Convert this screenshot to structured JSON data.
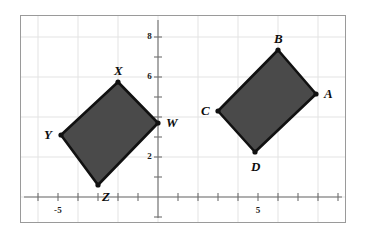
{
  "figure": {
    "background_color": "#ffffff",
    "frame_color": "#9a9a9a",
    "grid_color": "#e3e3e3",
    "axis_color": "#6f6f6f",
    "shape_fill_color": "#4a4a4a",
    "shape_stroke_color": "#111111",
    "vertex_dot_color": "#111111"
  },
  "axes": {
    "x_tick_labels": [
      {
        "text": "-5",
        "value": -5
      },
      {
        "text": "5",
        "value": 5
      }
    ],
    "y_tick_labels": [
      {
        "text": "8",
        "value": 8
      },
      {
        "text": "6",
        "value": 6
      },
      {
        "text": "2",
        "value": 2
      }
    ],
    "x_range": [
      -7,
      10.4
    ],
    "y_range": [
      -1.2,
      10.4
    ],
    "tick_interval": 1,
    "grid_interval": 2
  },
  "chart_data": {
    "type": "scatter",
    "xlabel": "",
    "ylabel": "",
    "xlim": [
      -7,
      10.4
    ],
    "ylim": [
      -1.2,
      10.4
    ],
    "grid": true,
    "legend": "none",
    "series": [
      {
        "name": "Quadrilateral WXYZ",
        "closed": true,
        "points": [
          {
            "label": "W",
            "x": 0.0,
            "y": 3.7,
            "label_position": "right"
          },
          {
            "label": "X",
            "x": -2.0,
            "y": 5.75,
            "label_position": "above"
          },
          {
            "label": "Y",
            "x": -4.85,
            "y": 3.1,
            "label_position": "left"
          },
          {
            "label": "Z",
            "x": -3.0,
            "y": 0.6,
            "label_position": "below-right"
          }
        ]
      },
      {
        "name": "Quadrilateral ABCD",
        "closed": true,
        "points": [
          {
            "label": "A",
            "x": 7.9,
            "y": 5.15,
            "label_position": "right"
          },
          {
            "label": "B",
            "x": 6.0,
            "y": 7.35,
            "label_position": "above"
          },
          {
            "label": "C",
            "x": 3.0,
            "y": 4.3,
            "label_position": "left"
          },
          {
            "label": "D",
            "x": 4.85,
            "y": 2.25,
            "label_position": "below"
          }
        ]
      }
    ]
  }
}
